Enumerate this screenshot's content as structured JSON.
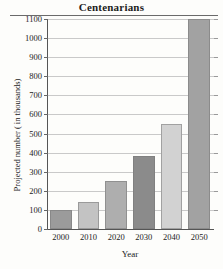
{
  "chart_data": {
    "type": "bar",
    "title": "Centenarians",
    "xlabel": "Year",
    "ylabel": "Projected number ( in thousands)",
    "categories": [
      "2000",
      "2010",
      "2020",
      "2030",
      "2040",
      "2050"
    ],
    "values": [
      100,
      140,
      250,
      380,
      550,
      1100
    ],
    "ylim": [
      0,
      1100
    ],
    "ytick_step": 100,
    "yticks": [
      "0",
      "100",
      "200",
      "300",
      "400",
      "500",
      "600",
      "700",
      "800",
      "900",
      "1000",
      "1100"
    ],
    "grid": true,
    "legend": "none",
    "bar_colors": [
      "#9b9b9b",
      "#c3c3c3",
      "#aeaeae",
      "#8b8b8b",
      "#d2d2d2",
      "#a2a2a2"
    ]
  }
}
